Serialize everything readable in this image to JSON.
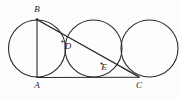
{
  "figure": {
    "canvas": {
      "width": 180,
      "height": 100
    },
    "background_color": "#fdfdfd",
    "stroke_color": "#2b2b2b",
    "labels": {
      "A": "A",
      "B": "B",
      "C": "C",
      "D": "D",
      "E": "E"
    },
    "points": {
      "A": {
        "x": 37,
        "y": 77.5
      },
      "B": {
        "x": 37,
        "y": 19.5
      },
      "C": {
        "x": 139,
        "y": 77.0
      },
      "D": {
        "x": 62.5,
        "y": 41.5
      },
      "E": {
        "x": 101.5,
        "y": 63.5
      }
    },
    "label_positions": {
      "A": {
        "x": 37,
        "y": 86
      },
      "B": {
        "x": 37,
        "y": 10
      },
      "C": {
        "x": 139,
        "y": 86
      },
      "D": {
        "x": 68,
        "y": 47
      },
      "E": {
        "x": 104,
        "y": 68
      }
    },
    "circles": [
      {
        "name": "circle-left",
        "cx": 37,
        "cy": 48.5,
        "r": 28.5
      },
      {
        "name": "circle-middle",
        "cx": 93.5,
        "cy": 48.5,
        "r": 28.5
      },
      {
        "name": "circle-right",
        "cx": 149.5,
        "cy": 48.5,
        "r": 28.5
      }
    ],
    "segments": [
      {
        "name": "segment-AB",
        "x1": 37,
        "y1": 19.5,
        "x2": 37,
        "y2": 77.5
      },
      {
        "name": "segment-AC",
        "x1": 37,
        "y1": 77.5,
        "x2": 139,
        "y2": 77.3
      },
      {
        "name": "segment-BC",
        "x1": 37,
        "y1": 19.5,
        "x2": 139,
        "y2": 77.0
      }
    ],
    "ghost_segments": [
      {
        "name": "ghost-BC-upper",
        "x1": 38,
        "y1": 20.5,
        "x2": 139,
        "y2": 76.2
      },
      {
        "name": "ghost-tangent-C",
        "x1": 121.5,
        "y1": 67.5,
        "x2": 139.5,
        "y2": 77.2
      }
    ]
  }
}
